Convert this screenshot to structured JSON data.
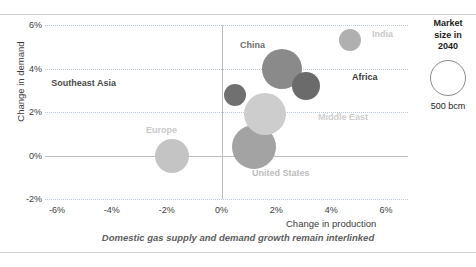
{
  "chart_data": {
    "type": "scatter",
    "title": "",
    "caption": "Domestic gas supply and demand growth remain interlinked",
    "xlabel": "Change in production",
    "ylabel": "Change in demand",
    "xticks": [
      "-6%",
      "-4%",
      "-2%",
      "0%",
      "2%",
      "4%",
      "6%"
    ],
    "xtickvals": [
      -6,
      -4,
      -2,
      0,
      2,
      4,
      6
    ],
    "yticks": [
      "6%",
      "4%",
      "2%",
      "0%",
      "-2%"
    ],
    "ytickvals": [
      6,
      4,
      2,
      0,
      -2
    ],
    "xlim": [
      -7,
      7
    ],
    "ylim": [
      -2,
      6
    ],
    "grid": "dotted horizontal gridlines at 6%, 4%, 2%, -2%; solid zero axes",
    "size_units": "bcm (market size in 2040)",
    "points": [
      {
        "name": "India",
        "x": 4.7,
        "y": 5.3,
        "r": 11,
        "color": "#b0b0b0",
        "label_color": "#c9c9c9",
        "label_x": 372,
        "label_y": 29,
        "align": "left"
      },
      {
        "name": "China",
        "x": 2.2,
        "y": 4.0,
        "r": 20,
        "color": "#8a8a8a",
        "label_color": "#6e6e6e",
        "label_x": 240,
        "label_y": 40,
        "align": "left"
      },
      {
        "name": "Africa",
        "x": 3.1,
        "y": 3.2,
        "r": 14,
        "color": "#6b6b6b",
        "label_color": "#3c3c3c",
        "label_x": 352,
        "label_y": 72,
        "align": "left"
      },
      {
        "name": "Southeast Asia",
        "x": 0.5,
        "y": 2.8,
        "r": 11,
        "color": "#707070",
        "label_color": "#4a4a4a",
        "label_x": 116,
        "label_y": 78,
        "align": "right"
      },
      {
        "name": "Middle East",
        "x": 1.6,
        "y": 1.9,
        "r": 21,
        "color": "#cdcdcd",
        "label_color": "#cfcfcf",
        "label_x": 318,
        "label_y": 112,
        "align": "left"
      },
      {
        "name": "United States",
        "x": 1.2,
        "y": 0.4,
        "r": 22,
        "color": "#a3a3a3",
        "label_color": "#bdbdbd",
        "label_x": 252,
        "label_y": 168,
        "align": "left"
      },
      {
        "name": "Europe",
        "x": -1.8,
        "y": 0.0,
        "r": 17,
        "color": "#c4c4c4",
        "label_color": "#c9c9c9",
        "label_x": 146,
        "label_y": 125,
        "align": "left"
      }
    ]
  },
  "legend": {
    "title_line1": "Market",
    "title_line2": "size in",
    "title_line3": "2040",
    "value": "500 bcm"
  }
}
